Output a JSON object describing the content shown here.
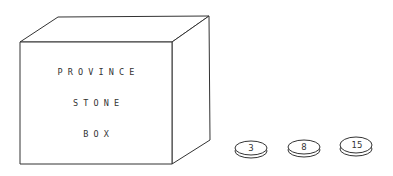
{
  "box": {
    "lines": [
      "P R O V I N C E",
      "S T O N E",
      "B O X"
    ]
  },
  "stones": [
    {
      "label": "3"
    },
    {
      "label": "8"
    },
    {
      "label": "15"
    }
  ]
}
